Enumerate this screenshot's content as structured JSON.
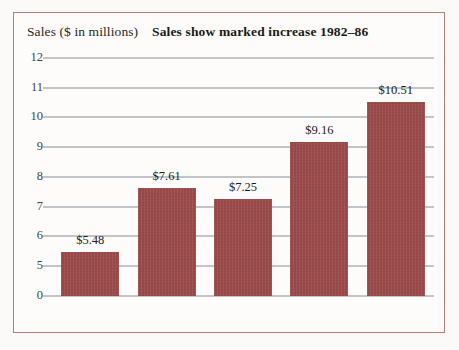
{
  "chart_data": {
    "type": "bar",
    "title": "Sales show marked increase 1982–86",
    "ylabel": "Sales ($ in millions)",
    "xlabel": "",
    "categories": [
      "1982",
      "1983",
      "1984",
      "1985",
      "1986"
    ],
    "values": [
      5.48,
      7.61,
      7.25,
      9.16,
      10.51
    ],
    "value_labels": [
      "$5.48",
      "$7.61",
      "$7.25",
      "$9.16",
      "$10.51"
    ],
    "ytick_labels": [
      "12",
      "11",
      "10",
      "9",
      "8",
      "7",
      "6",
      "5",
      "0"
    ],
    "ytick_values": [
      12,
      11,
      10,
      9,
      8,
      7,
      6,
      5,
      0
    ],
    "ylim": [
      0,
      12
    ],
    "axis_note": "broken axis: jumps from 0 to 5",
    "grid": true,
    "legend": false,
    "series": [
      {
        "name": "Sales",
        "values": [
          5.48,
          7.61,
          7.25,
          9.16,
          10.51
        ]
      }
    ],
    "colors": {
      "bar": "#9b4a4a",
      "gridline": "#b9bbbd",
      "frame": "#b08074",
      "background": "#fdfcfa",
      "text": "#25211e"
    }
  }
}
